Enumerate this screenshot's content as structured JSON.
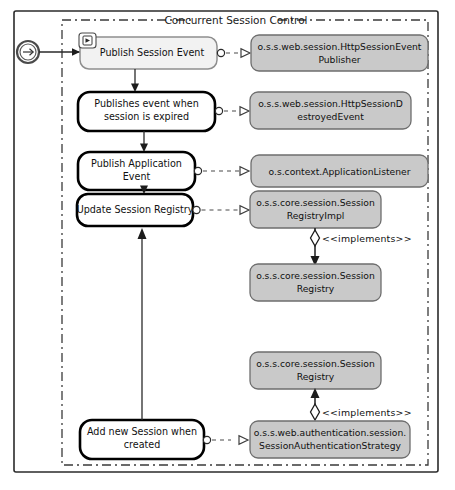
{
  "diagram": {
    "title": "Concurrent Session Control",
    "type": "uml-activity-diagram"
  },
  "start_node": {
    "name": "start-node",
    "glyph": "arrow-right-in-circle"
  },
  "activities": [
    {
      "id": "publish-session-event",
      "label_line1": "Publish Session Event",
      "label_line2": "",
      "style": "soft",
      "marker": "subprocess-play-marker"
    },
    {
      "id": "publishes-event-when-session-expired",
      "label_line1": "Publishes event when",
      "label_line2": "session is expired",
      "style": "bold",
      "marker": ""
    },
    {
      "id": "publish-application-event",
      "label_line1": "Publish Application",
      "label_line2": "Event",
      "style": "bold",
      "marker": ""
    },
    {
      "id": "update-session-registry",
      "label_line1": "Update Session Registry",
      "label_line2": "",
      "style": "bold",
      "marker": ""
    },
    {
      "id": "add-new-session-when-created",
      "label_line1": "Add new Session when",
      "label_line2": "created",
      "style": "bold",
      "marker": ""
    }
  ],
  "interfaces": [
    {
      "id": "http-session-event-publisher",
      "label_line1": "o.s.s.web.session.HttpSessionEvent",
      "label_line2": "Publisher"
    },
    {
      "id": "http-session-destroyed-event",
      "label_line1": "o.s.s.web.session.HttpSessionD",
      "label_line2": "estroyedEvent"
    },
    {
      "id": "application-listener",
      "label_line1": "o.s.context.ApplicationListener",
      "label_line2": ""
    },
    {
      "id": "session-registry-impl",
      "label_line1": "o.s.s.core.session.Session",
      "label_line2": "RegistryImpl"
    },
    {
      "id": "session-registry-upper",
      "label_line1": "o.s.s.core.session.Session",
      "label_line2": "Registry"
    },
    {
      "id": "session-registry-lower",
      "label_line1": "o.s.s.core.session.Session",
      "label_line2": "Registry"
    },
    {
      "id": "session-authentication-strategy",
      "label_line1": "o.s.s.web.authentication.session.",
      "label_line2": "SessionAuthenticationStrategy"
    }
  ],
  "relations": {
    "implements_upper_label": "<<implements>>",
    "implements_lower_label": "<<implements>>"
  },
  "colors": {
    "interface_fill": "#c9c9c9",
    "interface_stroke": "#6e6e6e",
    "activity_fill": "#ffffff",
    "activity_stroke": "#000000",
    "soft_activity_fill": "#f2f2f2",
    "frame_stroke": "#2b2b2b",
    "background": "#ffffff"
  }
}
